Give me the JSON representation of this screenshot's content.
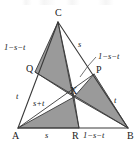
{
  "figure": {
    "kind": "geometry-diagram",
    "colors": {
      "shade_fill": "#9a9a9a",
      "stroke": "#3a3a3a",
      "text": "#1a1a1a",
      "background": "#ffffff"
    },
    "vertices": [
      {
        "key": "A",
        "label": "A",
        "x": 18,
        "y": 128
      },
      {
        "key": "B",
        "label": "B",
        "x": 128,
        "y": 128
      },
      {
        "key": "C",
        "label": "C",
        "x": 58,
        "y": 22
      },
      {
        "key": "Q",
        "label": "Q",
        "x": 35,
        "y": 72
      },
      {
        "key": "P",
        "label": "P",
        "x": 94,
        "y": 74
      },
      {
        "key": "R",
        "label": "R",
        "x": 79,
        "y": 128
      },
      {
        "key": "X",
        "label": "X",
        "x": 74,
        "y": 97
      }
    ],
    "vertex_labels": [
      {
        "name": "vertex-label-C",
        "text": "C",
        "left": 55,
        "top": 8
      },
      {
        "name": "vertex-label-Q",
        "text": "Q",
        "left": 26,
        "top": 64
      },
      {
        "name": "vertex-label-P",
        "text": "P",
        "left": 96,
        "top": 65
      },
      {
        "name": "vertex-label-X",
        "text": "X",
        "left": 70,
        "top": 86
      },
      {
        "name": "vertex-label-A",
        "text": "A",
        "left": 12,
        "top": 131
      },
      {
        "name": "vertex-label-R",
        "text": "R",
        "left": 72,
        "top": 131
      },
      {
        "name": "vertex-label-B",
        "text": "B",
        "left": 127,
        "top": 131
      }
    ],
    "edge_labels": [
      {
        "name": "edge-label-CQ",
        "text": "1−s−t",
        "left": 4,
        "top": 43,
        "for": "segment-C-Q"
      },
      {
        "name": "edge-label-QA",
        "text": "t",
        "left": 16,
        "top": 92,
        "for": "segment-Q-A"
      },
      {
        "name": "edge-label-CP",
        "text": "s",
        "left": 78,
        "top": 40,
        "for": "segment-C-P"
      },
      {
        "name": "edge-label-XP",
        "text": "1−s−t",
        "left": 98,
        "top": 52,
        "for": "segment-X-P"
      },
      {
        "name": "edge-label-PB",
        "text": "t",
        "left": 114,
        "top": 96,
        "for": "segment-P-B"
      },
      {
        "name": "edge-label-AR",
        "text": "s",
        "left": 45,
        "top": 131,
        "for": "segment-A-R"
      },
      {
        "name": "edge-label-RB",
        "text": "1−s−t",
        "left": 83,
        "top": 131,
        "for": "segment-R-B"
      },
      {
        "name": "edge-label-AX",
        "text": "s+t",
        "left": 33,
        "top": 99,
        "for": "segment-A-X"
      }
    ],
    "leader_line": {
      "name": "leader-line-to-XP",
      "points": "96,57 88,66 80,77"
    },
    "shaded_regions": [
      {
        "name": "shaded-triangle-CQX",
        "points": "58,22 35,72 74,97"
      },
      {
        "name": "shaded-triangle-AXR",
        "points": "18,128 74,97 79,128"
      },
      {
        "name": "shaded-triangle-XPB",
        "points": "74,97 94,74 128,128"
      }
    ],
    "outline_segments": [
      {
        "name": "segment-A-B",
        "x1": 18,
        "y1": 128,
        "x2": 128,
        "y2": 128
      },
      {
        "name": "segment-A-C",
        "x1": 18,
        "y1": 128,
        "x2": 58,
        "y2": 22
      },
      {
        "name": "segment-C-B",
        "x1": 58,
        "y1": 22,
        "x2": 128,
        "y2": 128
      }
    ],
    "cevian_segments": [
      {
        "name": "cevian-C-R",
        "x1": 58,
        "y1": 22,
        "x2": 79,
        "y2": 128
      },
      {
        "name": "cevian-A-P",
        "x1": 18,
        "y1": 128,
        "x2": 94,
        "y2": 74
      },
      {
        "name": "cevian-B-Q",
        "x1": 128,
        "y1": 128,
        "x2": 35,
        "y2": 72
      }
    ]
  }
}
